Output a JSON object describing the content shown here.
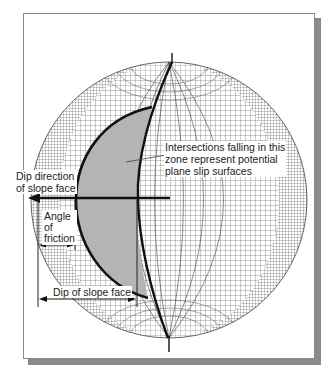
{
  "diagram": {
    "type": "stereonet-plane-failure-analysis",
    "labels": {
      "intersections_zone": [
        "Intersections falling in this",
        "zone represent potential",
        "plane slip surfaces"
      ],
      "dip_direction": [
        "Dip direction",
        "of slope face"
      ],
      "angle_of_friction": [
        "Angle",
        "of",
        "friction"
      ],
      "dip_of_slope_face": "Dip of slope face"
    },
    "colors": {
      "grid": "#555555",
      "shaded_zone": "#b4b4b4",
      "bold_lines": "#111111",
      "frame_shadow": "#8a8a8a",
      "background": "#ffffff"
    }
  }
}
